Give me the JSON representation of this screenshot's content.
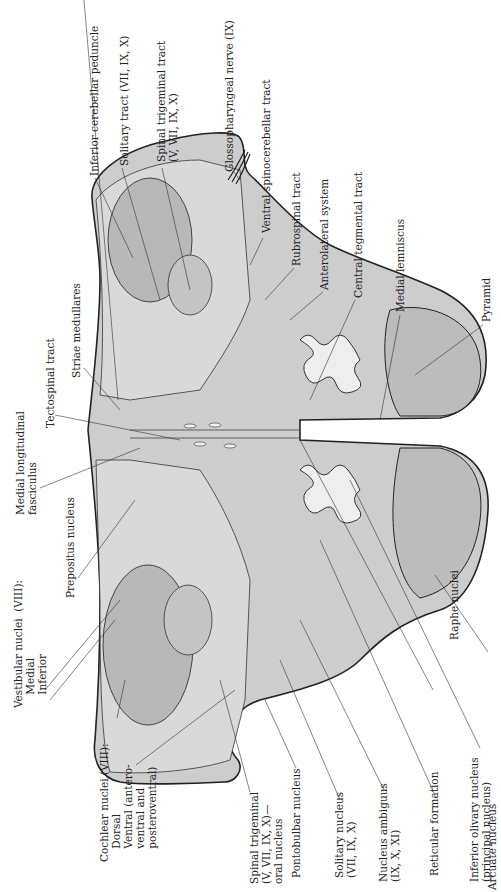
{
  "figure": {
    "colors": {
      "tissue": "#c8c8c8",
      "tissue_dark": "#b0b0b0",
      "white_matter": "#e2e2e2",
      "outline": "#222222",
      "background": "#ffffff"
    }
  },
  "labels_top": [
    {
      "id": "inferior-cerebellar-peduncle",
      "text": "Inferior cerebellar peduncle"
    },
    {
      "id": "solitary-tract",
      "text": "Solitary tract (VII, IX, X)"
    },
    {
      "id": "spinal-trigeminal-tract",
      "text": "Spinal trigeminal tract\n(V, VII, IX, X)"
    },
    {
      "id": "glossopharyngeal-nerve",
      "text": "Glossopharyngeal nerve (IX)"
    },
    {
      "id": "ventral-spinocerebellar-tract",
      "text": "Ventral spinocerebellar tract"
    },
    {
      "id": "rubrospinal-tract",
      "text": "Rubrospinal tract"
    },
    {
      "id": "anterolateral-system",
      "text": "Anterolateral system"
    },
    {
      "id": "central-tegmental-tract",
      "text": "Central tegmental tract"
    },
    {
      "id": "medial-lemniscus",
      "text": "Medial lemniscus"
    },
    {
      "id": "pyramid",
      "text": "Pyramid"
    }
  ],
  "labels_left": [
    {
      "id": "striae-medullares",
      "text": "Striae medullares"
    },
    {
      "id": "tectospinal-tract",
      "text": "Tectospinal tract"
    },
    {
      "id": "medial-longitudinal-fasciculus",
      "text": "Medial longitudinal\nfasciculus"
    },
    {
      "id": "prepositus-nucleus",
      "text": "Prepositus nucleus"
    },
    {
      "id": "vestibular-nuclei",
      "text": "Vestibular nuclei  (VIII):\n    Medial\n    Inferior"
    },
    {
      "id": "cochlear-nuclei",
      "text": "Cochlear nuclei (VIII):\n    Dorsal\n    Ventral (antero-\n    ventral and\n    posteroventral)"
    }
  ],
  "labels_bottom": [
    {
      "id": "spinal-trigeminal-oral-nucleus",
      "text": "Spinal trigeminal\n(V, VII, IX, X)—\noral nucleus"
    },
    {
      "id": "pontobulbar-nucleus",
      "text": "Pontobulbar nucleus"
    },
    {
      "id": "solitary-nucleus",
      "text": "Solitary nucleus\n(VII, IX, X)"
    },
    {
      "id": "nucleus-ambiguus",
      "text": "Nucleus ambiguus\n(IX, X, XI)"
    },
    {
      "id": "reticular-formation",
      "text": "Reticular formation"
    },
    {
      "id": "inferior-olivary-nucleus",
      "text": "Inferior olivary nucleus\n(principal nucleus)"
    },
    {
      "id": "raphe-nuclei",
      "text": "Raphe nuclei"
    },
    {
      "id": "arcuate-nucleus",
      "text": "Arcuate nucleus"
    }
  ]
}
